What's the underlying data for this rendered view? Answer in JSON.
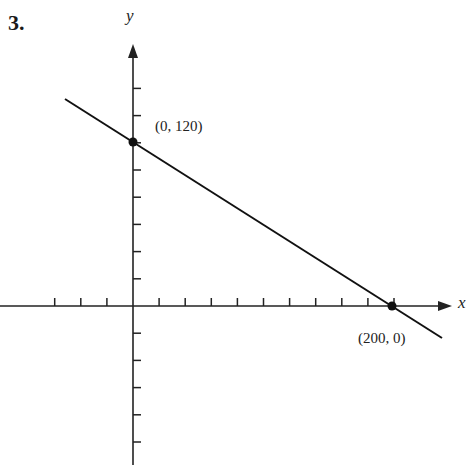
{
  "problem_number": "3.",
  "chart_data": {
    "type": "line",
    "title": "",
    "xlabel": "x",
    "ylabel": "y",
    "x_tick_step": 20,
    "y_tick_step": 24,
    "xlim": [
      -100,
      240
    ],
    "ylim": [
      -130,
      180
    ],
    "grid": false,
    "series": [
      {
        "name": "line",
        "x": [
          -50,
          0,
          200,
          250
        ],
        "y": [
          150,
          120,
          0,
          -30
        ]
      }
    ],
    "points": [
      {
        "x": 0,
        "y": 120,
        "label": "(0, 120)"
      },
      {
        "x": 200,
        "y": 0,
        "label": "(200, 0)"
      }
    ]
  },
  "labels": {
    "y_axis": "y",
    "x_axis": "x",
    "point1": "(0, 120)",
    "point2": "(200, 0)"
  }
}
